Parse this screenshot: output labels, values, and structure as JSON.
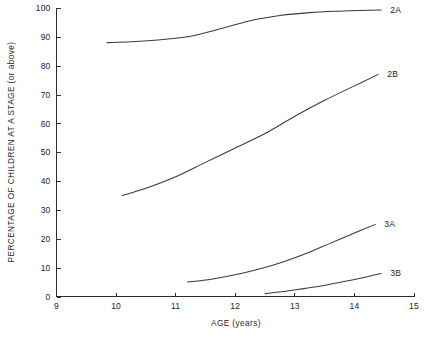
{
  "chart_data": {
    "type": "line",
    "title": "",
    "xlabel": "AGE (years)",
    "ylabel": "PERCENTAGE OF CHILDREN AT A STAGE (or above)",
    "xlim": [
      9,
      15
    ],
    "ylim": [
      0,
      100
    ],
    "xticks": [
      9,
      10,
      11,
      12,
      13,
      14,
      15
    ],
    "xtick_labels": [
      "9",
      "10",
      "11",
      "12",
      "13",
      "14",
      "15"
    ],
    "yticks": [
      0,
      10,
      20,
      30,
      40,
      50,
      60,
      70,
      80,
      90,
      100
    ],
    "ytick_labels": [
      "0",
      "10",
      "20",
      "30",
      "40",
      "50",
      "60",
      "70",
      "80",
      "90",
      "100"
    ],
    "grid": false,
    "legend_position": "right-of-curve-ends",
    "series": [
      {
        "name": "2A",
        "label": "2A",
        "color": "#3a3a3a",
        "x": [
          9.85,
          10.25,
          10.75,
          11.25,
          11.75,
          12.25,
          12.75,
          13.25,
          13.75,
          14.25,
          14.45
        ],
        "values": [
          88.0,
          88.3,
          89.0,
          90.2,
          92.8,
          95.6,
          97.4,
          98.4,
          98.9,
          99.2,
          99.3
        ]
      },
      {
        "name": "2B",
        "label": "2B",
        "color": "#3a3a3a",
        "x": [
          10.1,
          10.5,
          11.0,
          11.5,
          12.0,
          12.5,
          13.0,
          13.5,
          14.0,
          14.4
        ],
        "values": [
          35.0,
          37.5,
          41.5,
          46.5,
          51.5,
          56.5,
          62.5,
          68.0,
          73.0,
          77.0
        ]
      },
      {
        "name": "3A",
        "label": "3A",
        "color": "#3a3a3a",
        "x": [
          11.2,
          11.6,
          12.0,
          12.4,
          12.8,
          13.2,
          13.6,
          14.0,
          14.35
        ],
        "values": [
          5.0,
          6.0,
          7.5,
          9.5,
          12.0,
          15.0,
          18.5,
          22.0,
          25.0
        ]
      },
      {
        "name": "3B",
        "label": "3B",
        "color": "#3a3a3a",
        "x": [
          12.5,
          12.9,
          13.3,
          13.7,
          14.1,
          14.45
        ],
        "values": [
          1.0,
          2.0,
          3.2,
          4.7,
          6.3,
          8.0
        ]
      }
    ]
  },
  "axes": {
    "x_title": "AGE (years)",
    "y_title": "PERCENTAGE OF CHILDREN AT A STAGE (or above)"
  }
}
